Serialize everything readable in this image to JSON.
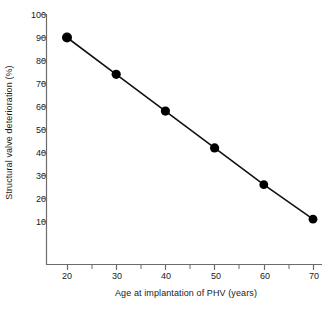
{
  "chart_data": {
    "type": "line",
    "title": "",
    "xlabel": "Age at implantation of PHV (years)",
    "ylabel": "Structural valve deterioration (%)",
    "x": [
      20,
      30,
      40,
      50,
      60,
      70
    ],
    "values": [
      90,
      74,
      58,
      42,
      26,
      11
    ],
    "series": [
      {
        "name": "Structural valve deterioration",
        "x": [
          20,
          30,
          40,
          50,
          60,
          70
        ],
        "values": [
          90,
          74,
          58,
          42,
          26,
          11
        ]
      }
    ],
    "xlim": [
      17,
      71
    ],
    "ylim": [
      4,
      100
    ],
    "xticks": [
      20,
      30,
      40,
      50,
      60,
      70
    ],
    "xticks_minor": [
      25,
      35,
      45,
      55,
      65
    ],
    "yticks": [
      10,
      20,
      30,
      40,
      50,
      60,
      70,
      80,
      90,
      100
    ],
    "xtick_labels": [
      "20",
      "30",
      "40",
      "50",
      "60",
      "70"
    ],
    "ytick_labels": [
      "10",
      "20",
      "30",
      "40",
      "50",
      "60",
      "70",
      "80",
      "90",
      "100"
    ],
    "grid": false,
    "legend": null,
    "legend_position": "none",
    "marker": "filled-circle",
    "marker_color": "#000000",
    "line_color": "#000000",
    "axis_color": "#6b6b6b",
    "background_color": "#ffffff"
  }
}
